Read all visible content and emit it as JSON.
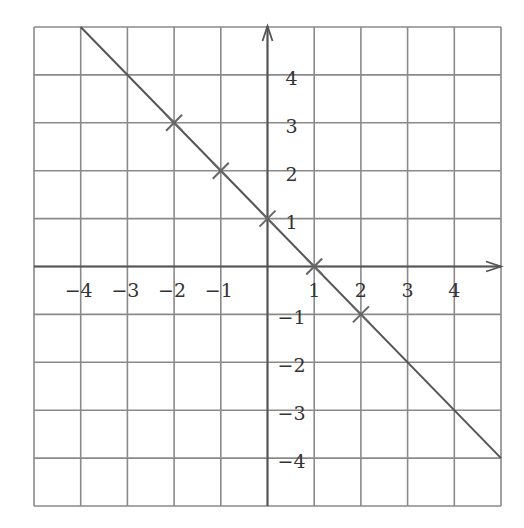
{
  "chart_data": {
    "type": "line",
    "title": "",
    "xlabel": "",
    "ylabel": "",
    "equation": "y = 1 - x",
    "xlim": [
      -5,
      5
    ],
    "ylim": [
      -5,
      5
    ],
    "grid": true,
    "x_ticks": [
      -4,
      -3,
      -2,
      -1,
      1,
      2,
      3,
      4
    ],
    "y_ticks": [
      4,
      3,
      2,
      1,
      -1,
      -2,
      -3,
      -4
    ],
    "x_tick_labels": [
      "−4",
      "−3",
      "−2",
      "−1",
      "1",
      "2",
      "3",
      "4"
    ],
    "y_tick_labels": [
      "4",
      "3",
      "2",
      "1",
      "−1",
      "−2",
      "−3",
      "−4"
    ],
    "line": {
      "from": [
        -4,
        5
      ],
      "to": [
        5,
        -4
      ]
    },
    "marked_points": [
      {
        "x": -2,
        "y": 3
      },
      {
        "x": -1,
        "y": 2
      },
      {
        "x": 0,
        "y": 1
      },
      {
        "x": 1,
        "y": 0
      },
      {
        "x": 2,
        "y": -1
      }
    ],
    "colors": {
      "grid": "#8a8a8a",
      "line": "#555555",
      "axes": "#555555",
      "text": "#333333"
    }
  }
}
